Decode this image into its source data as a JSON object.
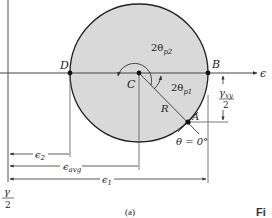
{
  "diagram": {
    "type": "mohrs-circle-strain",
    "caption": "(a)",
    "figure_tag": "Fi",
    "axes": {
      "horizontal_label": "ϵ",
      "vertical_label_num": "γ",
      "vertical_label_den": "2"
    },
    "points": {
      "D": "D",
      "B": "B",
      "C": "C",
      "A": "A"
    },
    "angles": {
      "two_theta_p2": {
        "prefix": "2θ",
        "sub": "p2"
      },
      "two_theta_p1": {
        "prefix": "2θ",
        "sub": "p1"
      },
      "theta_zero": "θ = 0°"
    },
    "radius_label": "R",
    "gamma_xy_half": {
      "num": "γ",
      "num_sub": "xy",
      "den": "2"
    },
    "dimensions": {
      "eps2": {
        "sym": "ϵ",
        "sub": "2"
      },
      "eps_avg": {
        "sym": "ϵ",
        "sub": "avg"
      },
      "eps1": {
        "sym": "ϵ",
        "sub": "1"
      }
    },
    "colors": {
      "circle_fill": "#d9d9d9",
      "line": "#333333",
      "circle_stroke": "#222222"
    }
  }
}
